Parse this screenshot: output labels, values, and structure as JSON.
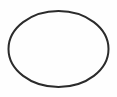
{
  "canvas": {
    "width": 117,
    "height": 97,
    "background_color": "#fefefe",
    "label": "Ellipse outline figure"
  },
  "figure": {
    "type": "ellipse-outline",
    "name": "ellipse",
    "stroke_color": "#2b2b2b",
    "stroke_width": 2,
    "fill": "none",
    "geometry": {
      "center_x": 58.5,
      "center_y": 49,
      "radius_x": 50,
      "radius_y": 38,
      "bbox_left": 8,
      "bbox_top": 11,
      "bbox_right": 109,
      "bbox_bottom": 87
    }
  },
  "annotations": {
    "text_items": [],
    "interior_content": "empty",
    "caption": ""
  }
}
